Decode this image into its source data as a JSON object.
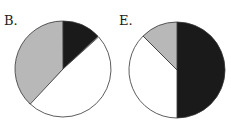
{
  "chart_data": [
    {
      "type": "pie",
      "label": "B.",
      "slices": [
        {
          "color": "#1a1a1a",
          "percent": 13,
          "start_deg": 0
        },
        {
          "color": "#ffffff",
          "percent": 49,
          "start_deg": 48
        },
        {
          "color": "#b8b8b8",
          "percent": 38,
          "start_deg": 223
        }
      ]
    },
    {
      "type": "pie",
      "label": "E.",
      "slices": [
        {
          "color": "#1a1a1a",
          "percent": 50,
          "start_deg": 0
        },
        {
          "color": "#ffffff",
          "percent": 37.5,
          "start_deg": 180
        },
        {
          "color": "#b8b8b8",
          "percent": 12.5,
          "start_deg": 315
        }
      ]
    }
  ]
}
